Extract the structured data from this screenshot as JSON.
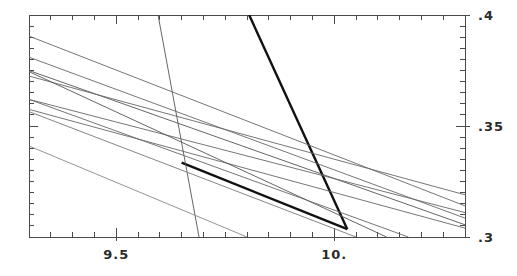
{
  "figure": {
    "width": 517,
    "height": 276,
    "background": "#ffffff",
    "plot_area": {
      "left": 29,
      "top": 15,
      "right": 465,
      "bottom": 237
    },
    "axis_color": "#4a4a4a",
    "label_color": "#2b2b2b"
  },
  "chart_data": {
    "type": "line",
    "title": "",
    "subtitle": "",
    "xlabel": "",
    "ylabel": "",
    "xlim": [
      9.3,
      10.3
    ],
    "ylim": [
      0.3,
      0.4
    ],
    "grid": false,
    "legend": null,
    "x_axis": {
      "position": "bottom",
      "tick_labels": [
        "9.5",
        "10."
      ],
      "tick_values": [
        9.5,
        10.0
      ],
      "major_tick_step": 0.5,
      "minor_tick_step": 0.05,
      "mirrored_top_axis": true
    },
    "y_axis": {
      "position": "right",
      "tick_labels": [
        ".4",
        ".35",
        ".3"
      ],
      "tick_values": [
        0.4,
        0.35,
        0.3
      ],
      "major_tick_step": 0.05,
      "minor_tick_step": 0.005,
      "mirrored_left_axis": true
    },
    "series": [
      {
        "name": "thick-segment-upper-right",
        "emphasis": "thick",
        "color": "#111111",
        "width": 2.4,
        "points": [
          [
            9.805,
            0.4
          ],
          [
            10.03,
            0.3035
          ]
        ]
      },
      {
        "name": "thick-segment-lower-left",
        "emphasis": "thick",
        "color": "#111111",
        "width": 2.4,
        "points": [
          [
            9.65,
            0.3335
          ],
          [
            10.03,
            0.3035
          ]
        ]
      },
      {
        "name": "steep-descending-line",
        "emphasis": "thin",
        "color": "#555555",
        "width": 0.9,
        "points": [
          [
            9.596,
            0.4
          ],
          [
            9.69,
            0.3
          ]
        ]
      },
      {
        "name": "shallow-line-a",
        "emphasis": "thin",
        "color": "#666666",
        "width": 0.9,
        "points": [
          [
            9.3,
            0.3905
          ],
          [
            10.3,
            0.314
          ]
        ]
      },
      {
        "name": "shallow-line-b",
        "emphasis": "thin",
        "color": "#666666",
        "width": 0.9,
        "points": [
          [
            9.3,
            0.381
          ],
          [
            10.3,
            0.3085
          ]
        ]
      },
      {
        "name": "shallow-line-c",
        "emphasis": "thin",
        "color": "#555555",
        "width": 0.9,
        "points": [
          [
            9.3,
            0.375
          ],
          [
            10.3,
            0.3055
          ]
        ]
      },
      {
        "name": "shallow-line-d",
        "emphasis": "thin",
        "color": "#666666",
        "width": 0.9,
        "points": [
          [
            9.3,
            0.3725
          ],
          [
            10.3,
            0.319
          ]
        ]
      },
      {
        "name": "shallow-line-e",
        "emphasis": "thin",
        "color": "#666666",
        "width": 0.9,
        "points": [
          [
            9.3,
            0.362
          ],
          [
            10.3,
            0.311
          ]
        ]
      },
      {
        "name": "shallow-line-f",
        "emphasis": "thin",
        "color": "#666666",
        "width": 0.9,
        "points": [
          [
            9.3,
            0.3575
          ],
          [
            10.3,
            0.304
          ]
        ]
      },
      {
        "name": "steep-line-g",
        "emphasis": "thin",
        "color": "#888888",
        "width": 0.9,
        "points": [
          [
            9.3,
            0.341
          ],
          [
            9.8,
            0.3
          ]
        ]
      },
      {
        "name": "mid-line-h",
        "emphasis": "thin",
        "color": "#555555",
        "width": 0.9,
        "points": [
          [
            9.3,
            0.3745
          ],
          [
            10.12,
            0.3
          ]
        ]
      },
      {
        "name": "mid-line-i",
        "emphasis": "thin",
        "color": "#666666",
        "width": 0.9,
        "points": [
          [
            9.3,
            0.362
          ],
          [
            10.17,
            0.3
          ]
        ]
      },
      {
        "name": "mid-line-j",
        "emphasis": "thin",
        "color": "#777777",
        "width": 0.9,
        "points": [
          [
            9.3,
            0.3565
          ],
          [
            10.05,
            0.3
          ]
        ]
      }
    ]
  }
}
